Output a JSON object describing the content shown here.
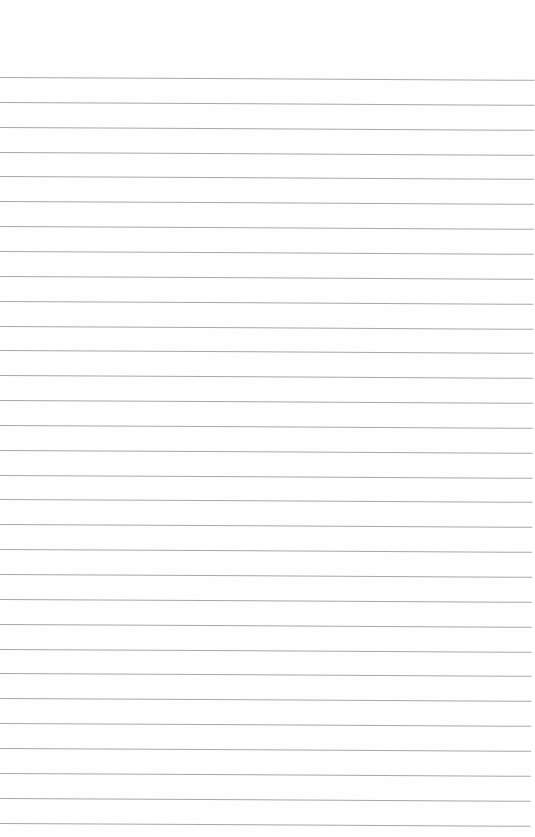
{
  "page": {
    "type": "lined-paper",
    "background": "#fefefe",
    "line_color": "#a8a8a8",
    "line_count": 31,
    "first_line_y": 77,
    "line_spacing": 24.85,
    "text": ""
  }
}
